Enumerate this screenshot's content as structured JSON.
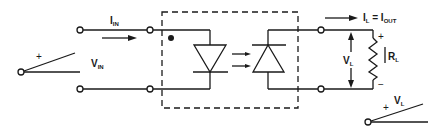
{
  "diagram": {
    "type": "optocoupler-schematic",
    "stroke_color": "#1a1a1a",
    "background": "#ffffff",
    "input": {
      "current_label": {
        "main": "I",
        "sub": "IN"
      },
      "voltage_label": {
        "main": "V",
        "sub": "IN"
      },
      "plus_sign": "+"
    },
    "output": {
      "current_label": {
        "main": "I",
        "sub": "L",
        "eq": " = ",
        "main2": "I",
        "sub2": "OUT"
      },
      "voltage_label": {
        "main": "V",
        "sub": "L"
      },
      "load_label": {
        "main": "R",
        "sub": "L"
      },
      "plus_sign": "+",
      "minus_sign": "−",
      "lever_voltage_label": {
        "main": "V",
        "sub": "L"
      },
      "lever_plus_sign": "+"
    },
    "components": [
      "LED (emitter)",
      "Photodiode (detector)",
      "Load resistor RL",
      "Dashed isolation package"
    ]
  }
}
